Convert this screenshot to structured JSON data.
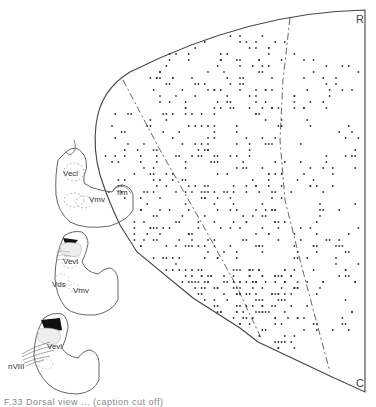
{
  "figure": {
    "main_section": {
      "corner_labels": {
        "top_right": "R",
        "bottom_right": "C"
      },
      "outline_color": "#444444",
      "dot_color": "#333333",
      "dashed_boundaries": 2,
      "dot_bands": [
        {
          "name": "left-of-left-dashed",
          "x0": 98,
          "x1": 150,
          "y0": 110,
          "y1": 300,
          "count": 45
        },
        {
          "name": "central-column",
          "x0": 150,
          "x1": 285,
          "y0": 30,
          "y1": 300,
          "count": 360
        },
        {
          "name": "central-lower",
          "x0": 195,
          "x1": 300,
          "y0": 270,
          "y1": 350,
          "count": 110
        },
        {
          "name": "right-of-right-dashed",
          "x0": 292,
          "x1": 362,
          "y0": 55,
          "y1": 330,
          "count": 120
        }
      ]
    },
    "insets": [
      {
        "id": "inset-top",
        "labels": [
          "Vecl",
          "Vmv",
          "flm"
        ],
        "has_lesion": false
      },
      {
        "id": "inset-middle",
        "labels": [
          "Vevl",
          "Vds",
          "Vmv"
        ],
        "has_lesion": true
      },
      {
        "id": "inset-bottom",
        "labels": [
          "Vevl",
          "nVIII"
        ],
        "has_lesion": true
      }
    ],
    "label_text": {
      "vecl": "Vecl",
      "vmv_top": "Vmv",
      "flm": "flm",
      "vevl_mid": "Vevl",
      "vds": "Vds",
      "vmv_mid": "Vmv",
      "vevl_bot": "Vevl",
      "nviii": "nVIII"
    },
    "caption_fragment": "F.33   Dorsal view ... (caption cut off)"
  }
}
